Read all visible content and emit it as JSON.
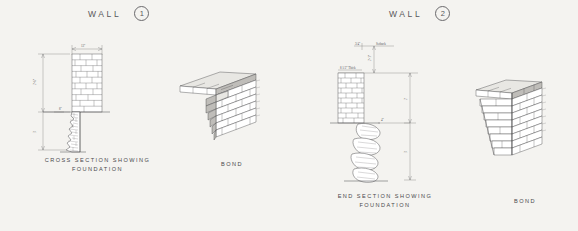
{
  "plate": {
    "background_color": "#f4f3f0",
    "ink_color": "#3a3a3c"
  },
  "panels": [
    {
      "id": "wall-1",
      "title_text": "WALL",
      "title_number": "1",
      "figures": [
        {
          "id": "wall-1-section",
          "type": "cross-section",
          "caption_line1": "CROSS  SECTION  SHOWING",
          "caption_line2": "FOUNDATION",
          "dimensions": [
            {
              "label": "13\"",
              "orientation": "horizontal",
              "position": "top-wall-width"
            },
            {
              "label": "2'-6\"",
              "orientation": "vertical",
              "position": "wall-height"
            },
            {
              "label": "3'",
              "orientation": "vertical",
              "position": "foundation-depth"
            },
            {
              "label": "8\"",
              "orientation": "horizontal",
              "position": "footing-offset"
            }
          ]
        },
        {
          "id": "wall-1-bond",
          "type": "isometric-bond",
          "caption_line1": "BOND",
          "caption_line2": ""
        }
      ]
    },
    {
      "id": "wall-2",
      "title_text": "WALL",
      "title_number": "2",
      "figures": [
        {
          "id": "wall-2-section",
          "type": "end-section",
          "caption_line1": "END  SECTION  SHOWING",
          "caption_line2": "FOUNDATION",
          "dimensions": [
            {
              "label": "Setback",
              "orientation": "note",
              "position": "top-note"
            },
            {
              "label": "2'-1\"",
              "orientation": "vertical",
              "position": "above-wall"
            },
            {
              "label": "8 1/2\" Thick",
              "orientation": "note",
              "position": "wall-thickness-note"
            },
            {
              "label": "2'",
              "orientation": "vertical",
              "position": "wall-height"
            },
            {
              "label": "4\"",
              "orientation": "horizontal",
              "position": "footing-offset"
            },
            {
              "label": "3'",
              "orientation": "vertical",
              "position": "foundation-depth"
            }
          ]
        },
        {
          "id": "wall-2-bond",
          "type": "isometric-bond",
          "caption_line1": "BOND",
          "caption_line2": ""
        }
      ]
    }
  ]
}
